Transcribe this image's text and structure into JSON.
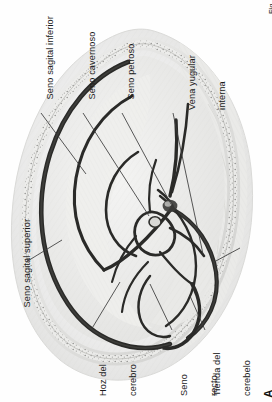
{
  "figure": {
    "panel_letter": "A",
    "corner_mark": "Fig",
    "orientation_degrees": -90,
    "language": "es"
  },
  "labels": [
    {
      "id": "seno-sagital-inferior",
      "text": "Seno sagital inferior",
      "lines": [
        "Seno sagital inferior"
      ]
    },
    {
      "id": "seno-cavernoso",
      "text": "Seno cavernoso",
      "lines": [
        "Seno cavernoso"
      ]
    },
    {
      "id": "seno-petroso",
      "text": "Seno petroso",
      "lines": [
        "Seno petroso"
      ]
    },
    {
      "id": "vena-yugular-interna",
      "text": "Vena yugular interna",
      "lines": [
        "Vena yugular",
        "interna"
      ]
    },
    {
      "id": "seno-transverso",
      "text": "Seno transverso",
      "lines": [
        "Seno transverso"
      ]
    },
    {
      "id": "seno-sagital-superior",
      "text": "Seno sagital superior",
      "lines": [
        "Seno sagital superior"
      ]
    },
    {
      "id": "hoz-del-cerebro",
      "text": "Hoz del cerebro",
      "lines": [
        "Hoz del",
        "cerebro"
      ]
    },
    {
      "id": "seno-recto",
      "text": "Seno recto",
      "lines": [
        "Seno",
        "recto"
      ]
    },
    {
      "id": "tienda-del-cerebelo",
      "text": "Tienda del cerebelo",
      "lines": [
        "Tienda del",
        "cerebelo"
      ]
    }
  ],
  "colors": {
    "background": "#ffffff",
    "ink": "#1b1b1b",
    "leader_line": "#3a3a3a",
    "tissue_light": "#f0f0ee",
    "tissue_mid": "#e2e2e0",
    "tissue_shadow": "#d2d2d0",
    "sinus_dark": "#2a2a28",
    "bone_speckle": "#8a8a88"
  }
}
